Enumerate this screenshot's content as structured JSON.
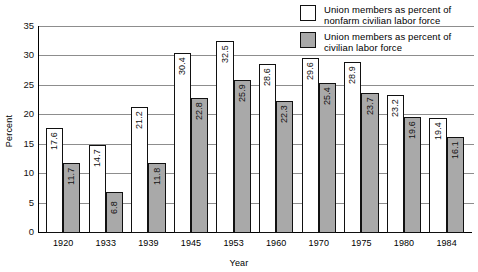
{
  "chart_data": {
    "type": "bar",
    "title": "",
    "xlabel": "Year",
    "ylabel": "Percent",
    "ylim": [
      0,
      35
    ],
    "yticks": [
      0,
      5,
      10,
      15,
      20,
      25,
      30,
      35
    ],
    "grid": true,
    "legend_position": "top-right",
    "categories": [
      "1920",
      "1933",
      "1939",
      "1945",
      "1953",
      "1960",
      "1970",
      "1975",
      "1980",
      "1984"
    ],
    "series": [
      {
        "name": "Union members as percent of nonfarm civilian labor force",
        "color": "#ffffff",
        "values": [
          17.6,
          14.7,
          21.2,
          30.4,
          32.5,
          28.6,
          29.6,
          28.9,
          23.2,
          19.4
        ]
      },
      {
        "name": "Union members as percent of civilian labor force",
        "color": "#a9a9a9",
        "values": [
          11.7,
          6.8,
          11.8,
          22.8,
          25.9,
          22.3,
          25.4,
          23.7,
          19.6,
          16.1
        ]
      }
    ]
  },
  "legend": {
    "items": [
      {
        "swatch": "white",
        "line1": "Union members as percent of",
        "line2": "nonfarm civilian labor force"
      },
      {
        "swatch": "gray",
        "line1": "Union members as percent of",
        "line2": "civilian labor force"
      }
    ]
  }
}
